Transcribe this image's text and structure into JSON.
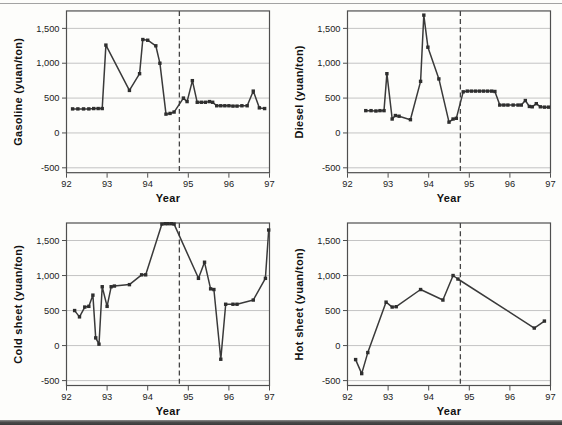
{
  "figure": {
    "top_rule_color": "#a3a3a3",
    "bottom_bar_color": "#4a4a4a"
  },
  "chart_style": {
    "line_color": "#3a3a3a",
    "marker_color": "#2e2e2e",
    "grid_color": "#bdbdbd",
    "frame_color": "#4f4f4f",
    "dash_color": "#444444",
    "tick_text_color": "#1c1c1c"
  },
  "axes": {
    "xlabel": "Year",
    "xlim": [
      92,
      97
    ],
    "xticks": [
      {
        "v": 92,
        "label": "92"
      },
      {
        "v": 93,
        "label": "93"
      },
      {
        "v": 94,
        "label": "94"
      },
      {
        "v": 95,
        "label": "95"
      },
      {
        "v": 96,
        "label": "96"
      },
      {
        "v": 97,
        "label": "97"
      }
    ],
    "ylim": [
      -570,
      1750
    ],
    "yticks": [
      {
        "v": -500,
        "label": "-500"
      },
      {
        "v": 0,
        "label": "0"
      },
      {
        "v": 500,
        "label": "500"
      },
      {
        "v": 1000,
        "label": "1,000"
      },
      {
        "v": 1500,
        "label": "1,500"
      }
    ],
    "dashed_vline_year": 94.78,
    "grid": "horizontal-only",
    "legend": "none"
  },
  "chart_data": [
    {
      "type": "line",
      "name": "gasoline",
      "ylabel": "Gasoline (yuan/ton)",
      "xlabel": "Year",
      "xlim": [
        92,
        97
      ],
      "ylim": [
        -570,
        1750
      ],
      "points": [
        [
          92.15,
          345
        ],
        [
          92.28,
          345
        ],
        [
          92.42,
          345
        ],
        [
          92.55,
          345
        ],
        [
          92.67,
          350
        ],
        [
          92.78,
          350
        ],
        [
          92.88,
          350
        ],
        [
          92.97,
          1260
        ],
        [
          93.55,
          610
        ],
        [
          93.8,
          850
        ],
        [
          93.88,
          1340
        ],
        [
          94.0,
          1330
        ],
        [
          94.2,
          1250
        ],
        [
          94.3,
          1000
        ],
        [
          94.45,
          270
        ],
        [
          94.55,
          280
        ],
        [
          94.65,
          300
        ],
        [
          94.88,
          500
        ],
        [
          94.97,
          450
        ],
        [
          95.1,
          750
        ],
        [
          95.22,
          440
        ],
        [
          95.32,
          440
        ],
        [
          95.42,
          440
        ],
        [
          95.52,
          450
        ],
        [
          95.6,
          440
        ],
        [
          95.7,
          390
        ],
        [
          95.8,
          390
        ],
        [
          95.9,
          390
        ],
        [
          96.0,
          390
        ],
        [
          96.1,
          385
        ],
        [
          96.2,
          385
        ],
        [
          96.32,
          390
        ],
        [
          96.45,
          390
        ],
        [
          96.6,
          600
        ],
        [
          96.75,
          360
        ],
        [
          96.88,
          350
        ]
      ]
    },
    {
      "type": "line",
      "name": "diesel",
      "ylabel": "Diesel (yuan/ton)",
      "xlabel": "Year",
      "xlim": [
        92,
        97
      ],
      "ylim": [
        -570,
        1750
      ],
      "points": [
        [
          92.45,
          320
        ],
        [
          92.58,
          320
        ],
        [
          92.7,
          315
        ],
        [
          92.8,
          320
        ],
        [
          92.9,
          320
        ],
        [
          92.97,
          850
        ],
        [
          93.1,
          200
        ],
        [
          93.18,
          250
        ],
        [
          93.27,
          240
        ],
        [
          93.55,
          190
        ],
        [
          93.8,
          740
        ],
        [
          93.88,
          1690
        ],
        [
          93.98,
          1230
        ],
        [
          94.25,
          775
        ],
        [
          94.5,
          155
        ],
        [
          94.6,
          200
        ],
        [
          94.68,
          210
        ],
        [
          94.85,
          590
        ],
        [
          94.95,
          600
        ],
        [
          95.05,
          600
        ],
        [
          95.15,
          600
        ],
        [
          95.25,
          600
        ],
        [
          95.35,
          600
        ],
        [
          95.45,
          600
        ],
        [
          95.55,
          600
        ],
        [
          95.63,
          595
        ],
        [
          95.75,
          400
        ],
        [
          95.85,
          400
        ],
        [
          95.95,
          400
        ],
        [
          96.08,
          400
        ],
        [
          96.2,
          400
        ],
        [
          96.28,
          400
        ],
        [
          96.38,
          465
        ],
        [
          96.48,
          380
        ],
        [
          96.55,
          375
        ],
        [
          96.65,
          420
        ],
        [
          96.75,
          375
        ],
        [
          96.85,
          370
        ],
        [
          96.95,
          370
        ]
      ]
    },
    {
      "type": "line",
      "name": "cold-sheet",
      "ylabel": "Cold sheet (yuan/ton)",
      "xlabel": "Year",
      "xlim": [
        92,
        97
      ],
      "ylim": [
        -570,
        1750
      ],
      "points": [
        [
          92.2,
          500
        ],
        [
          92.32,
          410
        ],
        [
          92.45,
          550
        ],
        [
          92.55,
          560
        ],
        [
          92.65,
          720
        ],
        [
          92.72,
          110
        ],
        [
          92.8,
          20
        ],
        [
          92.88,
          840
        ],
        [
          93.0,
          560
        ],
        [
          93.1,
          840
        ],
        [
          93.18,
          850
        ],
        [
          93.55,
          870
        ],
        [
          93.85,
          1010
        ],
        [
          93.95,
          1010
        ],
        [
          94.35,
          1735
        ],
        [
          94.43,
          1740
        ],
        [
          94.5,
          1740
        ],
        [
          94.58,
          1740
        ],
        [
          94.65,
          1735
        ],
        [
          95.25,
          960
        ],
        [
          95.4,
          1190
        ],
        [
          95.55,
          810
        ],
        [
          95.63,
          800
        ],
        [
          95.8,
          -195
        ],
        [
          95.92,
          590
        ],
        [
          96.1,
          590
        ],
        [
          96.2,
          590
        ],
        [
          96.6,
          650
        ],
        [
          96.9,
          960
        ],
        [
          96.98,
          1650
        ]
      ]
    },
    {
      "type": "line",
      "name": "hot-sheet",
      "ylabel": "Hot sheet (yuan/ton)",
      "xlabel": "Year",
      "xlim": [
        92,
        97
      ],
      "ylim": [
        -570,
        1750
      ],
      "points": [
        [
          92.2,
          -200
        ],
        [
          92.35,
          -400
        ],
        [
          92.5,
          -100
        ],
        [
          92.95,
          620
        ],
        [
          93.1,
          550
        ],
        [
          93.2,
          555
        ],
        [
          93.8,
          800
        ],
        [
          94.35,
          650
        ],
        [
          94.6,
          1000
        ],
        [
          94.72,
          950
        ],
        [
          96.6,
          250
        ],
        [
          96.85,
          350
        ]
      ]
    }
  ]
}
